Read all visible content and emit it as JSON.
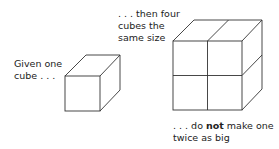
{
  "labels": {
    "given": [
      "Given one",
      "cube . . ."
    ],
    "then": [
      ". . . then four",
      "cubes the",
      "same size"
    ],
    "donot_prefix": ". . . do ",
    "donot_bold": "not",
    "donot_suffix": " make one",
    "donot_line2": "twice as big"
  },
  "colors": {
    "stroke": "#333333",
    "text": "#222222"
  }
}
